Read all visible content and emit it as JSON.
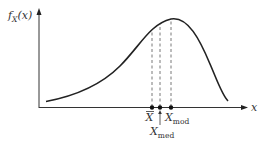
{
  "figure": {
    "type": "probability-density-diagram",
    "y_axis_label": {
      "main": "f",
      "subscript": "X",
      "arg": "(x)"
    },
    "x_axis_label": "x",
    "curve": "right-skewed unimodal density (negatively skewed: long left tail)",
    "markers": [
      {
        "name": "mean",
        "symbol": "X",
        "overbar": true,
        "subscript": ""
      },
      {
        "name": "median",
        "symbol": "X",
        "overbar": false,
        "subscript": "med"
      },
      {
        "name": "mode",
        "symbol": "X",
        "overbar": false,
        "subscript": "mod"
      }
    ],
    "colors": {
      "line": "#222222",
      "dash": "#555555",
      "text": "#333333"
    }
  }
}
